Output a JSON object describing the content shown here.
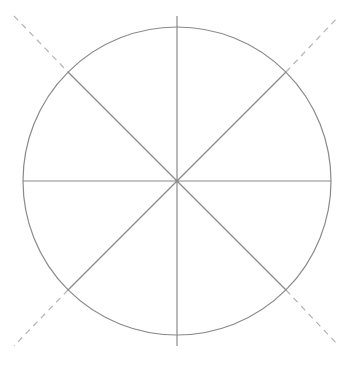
{
  "diagram": {
    "type": "circle-divided-into-eight-sectors",
    "canvas": {
      "width": 353,
      "height": 366,
      "background": "#ffffff"
    },
    "colors": {
      "solid_stroke": "#8a8a8a",
      "dashed_stroke": "#b4b4b4"
    },
    "circle": {
      "cx": 177,
      "cy": 181,
      "r": 154
    },
    "solid_lines": [
      {
        "name": "vertical-diameter",
        "x1": 177,
        "y1": 16,
        "x2": 177,
        "y2": 346
      },
      {
        "name": "horizontal-diameter",
        "x1": 23,
        "y1": 181,
        "x2": 331,
        "y2": 181
      },
      {
        "name": "diagonal-nw-se",
        "x1": 68,
        "y1": 72,
        "x2": 286,
        "y2": 290
      },
      {
        "name": "diagonal-ne-sw",
        "x1": 286,
        "y1": 72,
        "x2": 68,
        "y2": 290
      }
    ],
    "dashed_extensions": [
      {
        "name": "extension-nw",
        "x1": 14,
        "y1": 16,
        "x2": 68,
        "y2": 72
      },
      {
        "name": "extension-ne",
        "x1": 286,
        "y1": 72,
        "x2": 339,
        "y2": 16
      },
      {
        "name": "extension-sw",
        "x1": 68,
        "y1": 290,
        "x2": 14,
        "y2": 346
      },
      {
        "name": "extension-se",
        "x1": 286,
        "y1": 290,
        "x2": 339,
        "y2": 346
      }
    ],
    "sector_count": 8
  }
}
